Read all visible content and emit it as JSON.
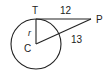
{
  "diagram": {
    "points": {
      "T": {
        "label": "T",
        "x": 36,
        "y": 19
      },
      "C": {
        "label": "C",
        "x": 36,
        "y": 44
      },
      "P": {
        "label": "P",
        "x": 90,
        "y": 19
      }
    },
    "circle": {
      "center": "C",
      "radius_px": 25
    },
    "segments": [
      {
        "from": "T",
        "to": "P",
        "label": "12"
      },
      {
        "from": "C",
        "to": "P",
        "label": "13"
      },
      {
        "from": "C",
        "to": "T",
        "label": "r"
      }
    ],
    "labels": {
      "T": "T",
      "P": "P",
      "C": "C",
      "r": "r",
      "TP": "12",
      "CP": "13"
    },
    "colors": {
      "stroke": "#222222",
      "background": "#ffffff"
    }
  }
}
